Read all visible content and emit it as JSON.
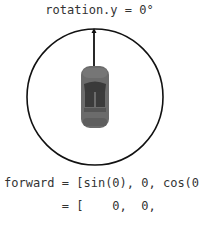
{
  "title": "rotation.y = 0°",
  "diagram": {
    "circle": {
      "cx": 95,
      "cy": 97,
      "r": 68,
      "stroke": "#111111"
    },
    "forward_arrow": {
      "x": 94,
      "y1": 66,
      "y2": 30,
      "color": "#111111"
    },
    "car": {
      "x": 81,
      "y": 65,
      "width": 28,
      "height": 63,
      "body_color": "#6b6b6b",
      "detail_color": "#333333",
      "icon": "car-top-view-icon"
    }
  },
  "equation": {
    "line1": "forward = [sin(0), 0, cos(0)]",
    "line2": "        = [    0,  0,      1]"
  }
}
